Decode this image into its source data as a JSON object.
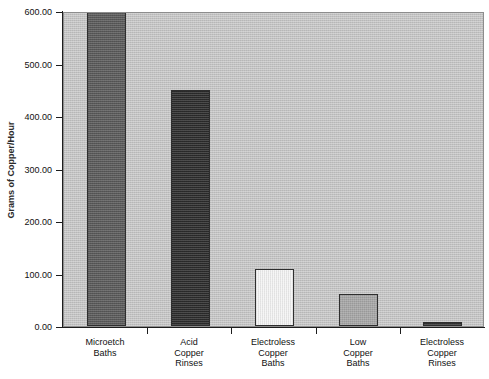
{
  "chart_data": {
    "type": "bar",
    "title": "",
    "xlabel": "",
    "ylabel": "Grams of Copper/Hour",
    "ylim": [
      0,
      600
    ],
    "ytick_labels": [
      "600.00",
      "500.00",
      "400.00",
      "300.00",
      "200.00",
      "100.00",
      "0.00"
    ],
    "ytick_values": [
      600,
      500,
      400,
      300,
      200,
      100,
      0
    ],
    "grid": false,
    "legend": "none",
    "categories": [
      "Microetch Baths",
      "Acid Copper Rinses",
      "Electroless Copper Baths",
      "Low Copper Baths",
      "Electroless Copper Rinses"
    ],
    "category_lines": [
      [
        "Microetch",
        "Baths"
      ],
      [
        "Acid",
        "Copper",
        "Rinses"
      ],
      [
        "Electroless",
        "Copper",
        "Baths"
      ],
      [
        "Low",
        "Copper",
        "Baths"
      ],
      [
        "Electroless",
        "Copper",
        "Rinses"
      ]
    ],
    "values": [
      600,
      450,
      109,
      60,
      8
    ],
    "bar_colors": [
      "#595959",
      "#2b2b2b",
      "#f4f4f4",
      "#a6a6a6",
      "#333333"
    ],
    "plot_background": "#c2c2c2",
    "axis_color": "#1d1d1d",
    "page_background": "#ffffff"
  }
}
